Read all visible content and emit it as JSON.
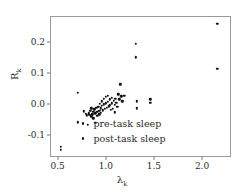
{
  "chart_data": {
    "type": "scatter",
    "title": "",
    "xlabel": "λ",
    "xlabel_sub": "k",
    "ylabel": "R",
    "ylabel_sub": "k",
    "xlim": [
      0.42,
      2.28
    ],
    "ylim": [
      -0.165,
      0.285
    ],
    "grid": false,
    "legend_position": "lower right",
    "xticks": [
      0.5,
      1.0,
      1.5,
      2.0
    ],
    "xtick_labels": [
      "0.5",
      "1.0",
      "1.5",
      "2.0"
    ],
    "yticks": [
      -0.1,
      0.0,
      0.1,
      0.2
    ],
    "ytick_labels": [
      "-0.1",
      "0.0",
      "0.1",
      "0.2"
    ],
    "marker_color": "#111111",
    "frame_color": "#9a9a9a",
    "series": [
      {
        "name": "pre-task sleep",
        "marker": "point",
        "color": "#111111",
        "points": [
          [
            0.52,
            -0.135
          ],
          [
            0.52,
            -0.145
          ],
          [
            0.7,
            0.04
          ],
          [
            0.7,
            -0.056
          ],
          [
            0.76,
            -0.02
          ],
          [
            0.78,
            -0.029
          ],
          [
            0.79,
            -0.033
          ],
          [
            0.8,
            -0.064
          ],
          [
            0.81,
            -0.027
          ],
          [
            0.82,
            -0.031
          ],
          [
            0.83,
            -0.019
          ],
          [
            0.84,
            -0.036
          ],
          [
            0.84,
            -0.01
          ],
          [
            0.85,
            -0.03
          ],
          [
            0.86,
            -0.022
          ],
          [
            0.86,
            -0.043
          ],
          [
            0.87,
            -0.014
          ],
          [
            0.88,
            -0.027
          ],
          [
            0.88,
            -0.057
          ],
          [
            0.89,
            -0.008
          ],
          [
            0.9,
            -0.021
          ],
          [
            0.9,
            -0.035
          ],
          [
            0.91,
            -0.005
          ],
          [
            0.92,
            -0.018
          ],
          [
            0.92,
            -0.03
          ],
          [
            0.93,
            0.004
          ],
          [
            0.94,
            -0.011
          ],
          [
            0.94,
            -0.025
          ],
          [
            0.95,
            0.012
          ],
          [
            0.95,
            -0.003
          ],
          [
            0.96,
            -0.017
          ],
          [
            0.97,
            0.02
          ],
          [
            0.97,
            0.002
          ],
          [
            0.98,
            -0.012
          ],
          [
            0.99,
            0.026
          ],
          [
            0.99,
            0.006
          ],
          [
            1.0,
            -0.008
          ],
          [
            1.01,
            0.03
          ],
          [
            1.01,
            0.01
          ],
          [
            1.02,
            -0.004
          ],
          [
            1.03,
            0.018
          ],
          [
            1.03,
            -0.001
          ],
          [
            1.04,
            -0.016
          ],
          [
            1.05,
            0.024
          ],
          [
            1.05,
            0.005
          ],
          [
            1.06,
            -0.012
          ],
          [
            1.07,
            0.014
          ],
          [
            1.08,
            0.0
          ],
          [
            1.08,
            -0.024
          ],
          [
            1.09,
            0.021
          ],
          [
            1.1,
            0.008
          ],
          [
            1.11,
            -0.006
          ],
          [
            1.12,
            0.035
          ],
          [
            1.13,
            0.018
          ],
          [
            1.14,
            0.067
          ],
          [
            1.15,
            0.028
          ],
          [
            1.16,
            0.012
          ],
          [
            1.18,
            0.03
          ],
          [
            1.3,
            0.199
          ],
          [
            1.3,
            0.155
          ],
          [
            1.31,
            0.012
          ],
          [
            1.31,
            -0.01
          ],
          [
            1.45,
            0.018
          ],
          [
            1.45,
            0.008
          ],
          [
            2.15,
            0.262
          ],
          [
            2.15,
            0.118
          ]
        ]
      },
      {
        "name": "post-task sleep",
        "marker": "point",
        "color": "#111111",
        "points": []
      }
    ]
  },
  "legend": {
    "entries": [
      {
        "label": "pre-task sleep"
      },
      {
        "label": "post-task sleep"
      }
    ]
  }
}
